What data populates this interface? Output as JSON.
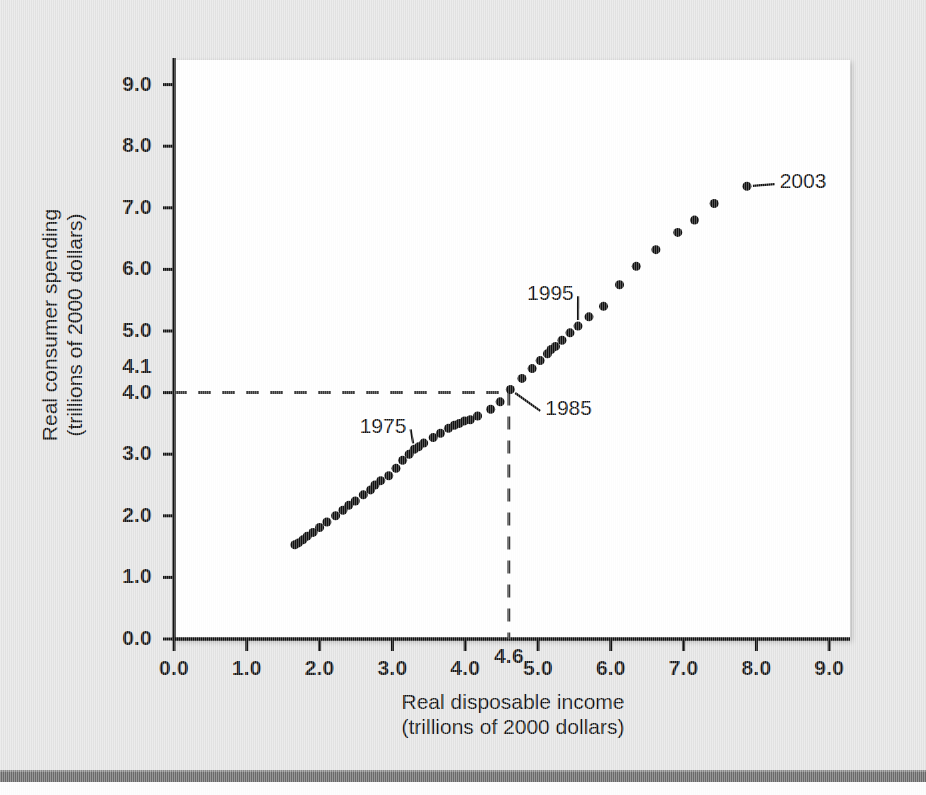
{
  "chart_data": {
    "type": "scatter",
    "title": "",
    "xlabel": "Real disposable income",
    "xlabel_sub": "(trillions of 2000 dollars)",
    "ylabel": "Real consumer spending",
    "ylabel_sub": "(trillions of 2000 dollars)",
    "xlim": [
      0.0,
      9.4
    ],
    "ylim": [
      0.0,
      9.4
    ],
    "xticks": [
      "0.0",
      "1.0",
      "2.0",
      "3.0",
      "4.0",
      "5.0",
      "6.0",
      "7.0",
      "8.0",
      "9.0"
    ],
    "xtick_values": [
      0,
      1,
      2,
      3,
      4,
      5,
      6,
      7,
      8,
      9
    ],
    "yticks": [
      "0.0",
      "1.0",
      "2.0",
      "3.0",
      "4.0",
      "5.0",
      "6.0",
      "7.0",
      "8.0",
      "9.0"
    ],
    "ytick_values": [
      0,
      1,
      2,
      3,
      4,
      5,
      6,
      7,
      8,
      9
    ],
    "grid": false,
    "legend": "none",
    "marker_color": "#101010",
    "marker_size": 9,
    "reference_lines": {
      "x_value": 4.6,
      "x_label": "4.6",
      "y_value": 4.1,
      "y_label": "4.1",
      "style": "dashed",
      "color": "#3a3a3a"
    },
    "annotations": [
      {
        "label": "1975",
        "x": 3.3,
        "y": 3.08,
        "text_x": 2.55,
        "text_y": 3.42
      },
      {
        "label": "1985",
        "x": 4.62,
        "y": 4.05,
        "text_x": 5.1,
        "text_y": 3.72
      },
      {
        "label": "1995",
        "x": 5.55,
        "y": 5.08,
        "text_x": 4.85,
        "text_y": 5.58
      },
      {
        "label": "2003",
        "x": 7.87,
        "y": 7.35,
        "text_x": 8.32,
        "text_y": 7.4
      }
    ],
    "points": [
      {
        "x": 1.66,
        "y": 1.53
      },
      {
        "x": 1.71,
        "y": 1.56
      },
      {
        "x": 1.77,
        "y": 1.61
      },
      {
        "x": 1.83,
        "y": 1.67
      },
      {
        "x": 1.91,
        "y": 1.73
      },
      {
        "x": 2.0,
        "y": 1.81
      },
      {
        "x": 2.1,
        "y": 1.9
      },
      {
        "x": 2.22,
        "y": 2.0
      },
      {
        "x": 2.32,
        "y": 2.09
      },
      {
        "x": 2.4,
        "y": 2.17
      },
      {
        "x": 2.49,
        "y": 2.24
      },
      {
        "x": 2.6,
        "y": 2.34
      },
      {
        "x": 2.7,
        "y": 2.42
      },
      {
        "x": 2.76,
        "y": 2.5
      },
      {
        "x": 2.84,
        "y": 2.57
      },
      {
        "x": 2.95,
        "y": 2.65
      },
      {
        "x": 3.05,
        "y": 2.77
      },
      {
        "x": 3.14,
        "y": 2.9
      },
      {
        "x": 3.23,
        "y": 3.0
      },
      {
        "x": 3.3,
        "y": 3.08
      },
      {
        "x": 3.36,
        "y": 3.12
      },
      {
        "x": 3.43,
        "y": 3.18
      },
      {
        "x": 3.56,
        "y": 3.27
      },
      {
        "x": 3.66,
        "y": 3.34
      },
      {
        "x": 3.77,
        "y": 3.42
      },
      {
        "x": 3.85,
        "y": 3.47
      },
      {
        "x": 3.92,
        "y": 3.5
      },
      {
        "x": 3.99,
        "y": 3.54
      },
      {
        "x": 4.07,
        "y": 3.56
      },
      {
        "x": 4.17,
        "y": 3.62
      },
      {
        "x": 4.35,
        "y": 3.73
      },
      {
        "x": 4.48,
        "y": 3.85
      },
      {
        "x": 4.62,
        "y": 4.05
      },
      {
        "x": 4.78,
        "y": 4.23
      },
      {
        "x": 4.92,
        "y": 4.39
      },
      {
        "x": 5.03,
        "y": 4.52
      },
      {
        "x": 5.13,
        "y": 4.63
      },
      {
        "x": 5.18,
        "y": 4.7
      },
      {
        "x": 5.24,
        "y": 4.75
      },
      {
        "x": 5.33,
        "y": 4.85
      },
      {
        "x": 5.44,
        "y": 4.97
      },
      {
        "x": 5.55,
        "y": 5.08
      },
      {
        "x": 5.7,
        "y": 5.23
      },
      {
        "x": 5.9,
        "y": 5.4
      },
      {
        "x": 6.12,
        "y": 5.75
      },
      {
        "x": 6.35,
        "y": 6.05
      },
      {
        "x": 6.62,
        "y": 6.32
      },
      {
        "x": 6.92,
        "y": 6.6
      },
      {
        "x": 7.15,
        "y": 6.8
      },
      {
        "x": 7.42,
        "y": 7.07
      },
      {
        "x": 7.87,
        "y": 7.35
      }
    ]
  },
  "figure": {
    "background_color": "#e4e4e4",
    "panel_color": "#ffffff",
    "bottom_rule_color": "#6a6a6a"
  }
}
